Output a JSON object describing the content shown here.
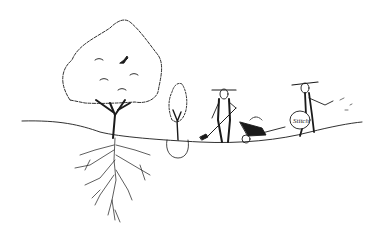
{
  "illustration": {
    "description": "Pen-and-ink sketch: large tree with extensive roots, a young sapling with root ball, a man digging with a shovel next to a wheelbarrow of soil, and a second man carrying a sack while sowing",
    "sack_label": "Stitch",
    "colors": {
      "ink": "#1a1a1a",
      "background": "#ffffff"
    }
  }
}
